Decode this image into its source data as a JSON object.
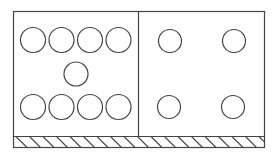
{
  "diagram": {
    "stroke_color": "#444444",
    "background": "#ffffff",
    "frame": {
      "x": 13.5,
      "y": 11.5,
      "width": 251,
      "height": 136
    },
    "divider_x": 138.5,
    "ground_strip": {
      "y": 136.5,
      "height": 11,
      "hatch_spacing": 13.5,
      "hatch_direction": "top-left-to-bottom-right"
    },
    "panels": [
      {
        "name": "left-panel",
        "circles": [
          {
            "cx": 33,
            "cy": 40,
            "r": 12.5
          },
          {
            "cx": 61.5,
            "cy": 40,
            "r": 12.5
          },
          {
            "cx": 90,
            "cy": 40,
            "r": 12.5
          },
          {
            "cx": 118.5,
            "cy": 40,
            "r": 12.5
          },
          {
            "cx": 76,
            "cy": 74,
            "r": 12
          },
          {
            "cx": 33,
            "cy": 107,
            "r": 12.5
          },
          {
            "cx": 61.5,
            "cy": 107,
            "r": 12.5
          },
          {
            "cx": 90,
            "cy": 107,
            "r": 12.5
          },
          {
            "cx": 118.5,
            "cy": 107,
            "r": 12.5
          }
        ]
      },
      {
        "name": "right-panel",
        "circles": [
          {
            "cx": 170,
            "cy": 41,
            "r": 11.5
          },
          {
            "cx": 234,
            "cy": 41,
            "r": 11.5
          },
          {
            "cx": 169,
            "cy": 107,
            "r": 11.5
          },
          {
            "cx": 233,
            "cy": 107,
            "r": 11.5
          }
        ]
      }
    ]
  }
}
